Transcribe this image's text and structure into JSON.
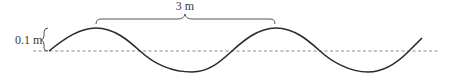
{
  "diagram": {
    "type": "transverse-wave",
    "wavelength_label": "3 m",
    "amplitude_label": "0.1 m",
    "colors": {
      "wave": "#2b2b2b",
      "baseline": "#8a8a8a",
      "brace": "#555555",
      "text": "#3a3a3a"
    }
  }
}
